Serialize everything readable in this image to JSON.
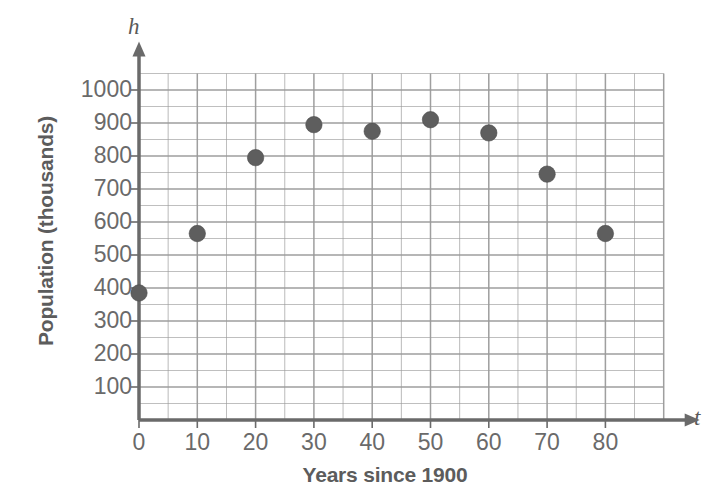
{
  "chart_data": {
    "type": "scatter",
    "title": "",
    "xlabel": "Years since 1900",
    "ylabel": "Population (thousands)",
    "x_axis_symbol": "t",
    "y_axis_symbol": "h",
    "xlim": [
      0,
      90
    ],
    "ylim": [
      0,
      1050
    ],
    "xticks": [
      0,
      10,
      20,
      30,
      40,
      50,
      60,
      70,
      80
    ],
    "yticks": [
      100,
      200,
      300,
      400,
      500,
      600,
      700,
      800,
      900,
      1000
    ],
    "xtick_labels": [
      "0",
      "10",
      "20",
      "30",
      "40",
      "50",
      "60",
      "70",
      "80"
    ],
    "ytick_labels": [
      "100",
      "200",
      "300",
      "400",
      "500",
      "600",
      "700",
      "800",
      "900",
      "1000"
    ],
    "grid": true,
    "minor_grid_x_step": 5,
    "minor_grid_y_step": 50,
    "legend": "none",
    "x": [
      0,
      10,
      20,
      30,
      40,
      50,
      60,
      70,
      80
    ],
    "values": [
      385,
      565,
      795,
      895,
      875,
      910,
      870,
      745,
      565
    ],
    "points": [
      {
        "t": 0,
        "h": 385
      },
      {
        "t": 10,
        "h": 565
      },
      {
        "t": 20,
        "h": 795
      },
      {
        "t": 30,
        "h": 895
      },
      {
        "t": 40,
        "h": 875
      },
      {
        "t": 50,
        "h": 910
      },
      {
        "t": 60,
        "h": 870
      },
      {
        "t": 70,
        "h": 745
      },
      {
        "t": 80,
        "h": 565
      }
    ],
    "marker_color": "#5e5e5e",
    "grid_color": "#9a9a9a",
    "axis_color": "#6a6a6a",
    "text_color": "#5c5c5c"
  }
}
